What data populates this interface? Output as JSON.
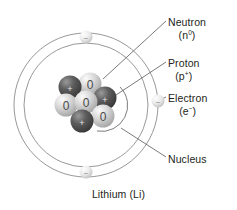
{
  "diagram": {
    "element_caption": "Lithium (Li)",
    "colors": {
      "background": "#ffffff",
      "line": "#6d6e71",
      "text": "#231f20",
      "proton_dark": "#4b4b4b",
      "proton_light": "#8f8f8f",
      "neutron_dark": "#9d9d9d",
      "neutron_light": "#efefef",
      "electron_light": "#f2f2f2",
      "electron_dark": "#b9b9b9"
    },
    "labels": [
      {
        "id": "neutron",
        "name": "Neutron",
        "symbol": "n",
        "charge": "0",
        "charge_display": "(n0)"
      },
      {
        "id": "proton",
        "name": "Proton",
        "symbol": "p",
        "charge": "+",
        "charge_display": "(p+)"
      },
      {
        "id": "electron",
        "name": "Electron",
        "symbol": "e",
        "charge": "−",
        "charge_display": "(e−)"
      },
      {
        "id": "nucleus",
        "name": "Nucleus",
        "symbol": "",
        "charge": "",
        "charge_display": ""
      }
    ],
    "shells": [
      {
        "id": "outer-shell",
        "label": "outer electron shell",
        "electrons": 1
      },
      {
        "id": "inner-shell",
        "label": "inner electron shell",
        "electrons": 2
      }
    ],
    "electrons": [
      {
        "id": "electron-top",
        "shell": "inner",
        "glyph": "−"
      },
      {
        "id": "electron-bottom",
        "shell": "inner",
        "glyph": "−"
      },
      {
        "id": "electron-right",
        "shell": "outer",
        "glyph": "−"
      }
    ],
    "nucleus": {
      "proton_count": 3,
      "neutron_count": 4,
      "proton_glyph": "+",
      "neutron_glyph": "0",
      "particles": [
        {
          "id": "neutron-1",
          "type": "neutron",
          "glyph": "0"
        },
        {
          "id": "proton-1",
          "type": "proton",
          "glyph": "+"
        },
        {
          "id": "neutron-2",
          "type": "neutron",
          "glyph": "0"
        },
        {
          "id": "neutron-3",
          "type": "neutron",
          "glyph": "0"
        },
        {
          "id": "proton-2",
          "type": "proton",
          "glyph": "+"
        },
        {
          "id": "neutron-4",
          "type": "neutron",
          "glyph": "0"
        },
        {
          "id": "proton-3",
          "type": "proton",
          "glyph": "+"
        }
      ]
    }
  }
}
